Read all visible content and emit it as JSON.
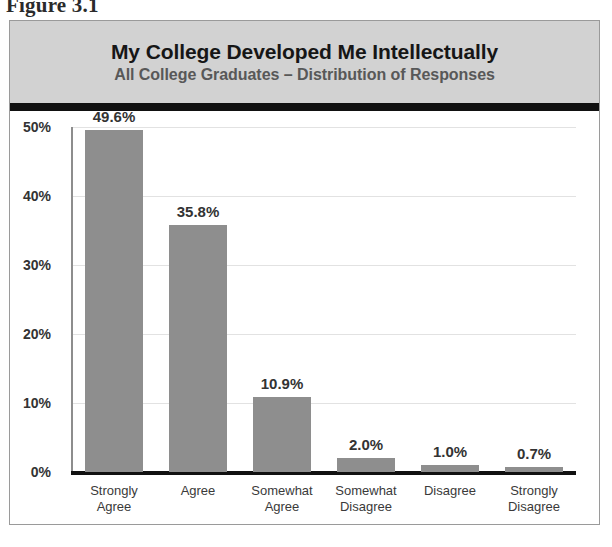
{
  "figure": {
    "caption": "Figure 3.1"
  },
  "header": {
    "title": "My College Developed Me Intellectually",
    "subtitle": "All College Graduates – Distribution of Responses"
  },
  "colors": {
    "header_band": "#d2d2d2",
    "header_rule": "#111111",
    "bar_fill": "#8e8e8e",
    "gridline": "#e2e2e2",
    "axis_line": "#111111",
    "label_text": "#333333",
    "subtitle_text": "#585858"
  },
  "chart_data": {
    "type": "bar",
    "title": "My College Developed Me Intellectually",
    "subtitle": "All College Graduates – Distribution of Responses",
    "xlabel": "",
    "ylabel": "",
    "categories": [
      "Strongly\nAgree",
      "Agree",
      "Somewhat\nAgree",
      "Somewhat\nDisagree",
      "Disagree",
      "Strongly\nDisagree"
    ],
    "values": [
      49.6,
      35.8,
      10.9,
      2.0,
      1.0,
      0.7
    ],
    "value_labels": [
      "49.6%",
      "35.8%",
      "10.9%",
      "2.0%",
      "1.0%",
      "0.7%"
    ],
    "ylim": [
      0,
      50
    ],
    "yticks": [
      0,
      10,
      20,
      30,
      40,
      50
    ],
    "ytick_labels": [
      "0%",
      "10%",
      "20%",
      "30%",
      "40%",
      "50%"
    ],
    "grid": true,
    "grid_axis": "y",
    "legend": false,
    "legend_position": "none"
  }
}
